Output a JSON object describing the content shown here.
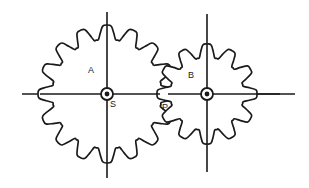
{
  "figure": {
    "background_color": "#ffffff",
    "line_color": "#1a1a1a",
    "width": 309,
    "height": 188
  },
  "labels": {
    "gear_a": "A",
    "gear_b": "B",
    "shaft_s": "S",
    "pitch_point_p": "P"
  },
  "gears": [
    {
      "id": "gear-a",
      "label": "A",
      "teeth": 16,
      "center_x": 107,
      "center_y": 94,
      "outer_radius": 69,
      "root_radius": 55,
      "pitch_radius": 62,
      "hub_label": "S",
      "hub_outer_radius": 6,
      "hub_inner_radius": 2.4
    },
    {
      "id": "gear-b",
      "label": "B",
      "teeth": 12,
      "center_x": 207,
      "center_y": 94,
      "outer_radius": 50,
      "root_radius": 37,
      "pitch_radius": 44,
      "hub_label": "",
      "hub_outer_radius": 6,
      "hub_inner_radius": 2.4
    }
  ],
  "axes": {
    "horizontal": {
      "x1": 22,
      "y1": 94,
      "x2": 295,
      "y2": 94
    },
    "vertical_a": {
      "x1": 107,
      "y1": 12,
      "x2": 107,
      "y2": 178
    },
    "vertical_b": {
      "x1": 207,
      "y1": 14,
      "x2": 207,
      "y2": 172
    }
  },
  "annotations": [
    {
      "name": "label-a",
      "text": "A",
      "x": 88,
      "y": 73
    },
    {
      "name": "label-b",
      "text": "B",
      "x": 188,
      "y": 78
    },
    {
      "name": "label-s",
      "text": "S",
      "x": 110,
      "y": 107
    },
    {
      "name": "label-p",
      "text": "P",
      "x": 162,
      "y": 110
    }
  ],
  "pitch_point": {
    "x": 163,
    "y": 94
  }
}
